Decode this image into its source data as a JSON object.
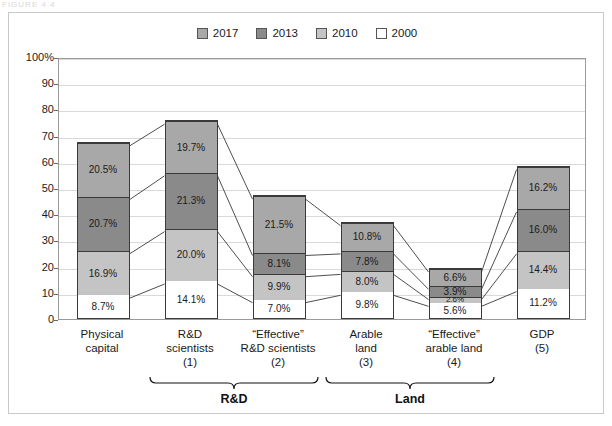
{
  "caption_fragment": "FIGURE 4.4",
  "legend": {
    "items": [
      {
        "label": "2017",
        "color": "#a8a8a8"
      },
      {
        "label": "2013",
        "color": "#8a8a8a"
      },
      {
        "label": "2010",
        "color": "#c4c4c4"
      },
      {
        "label": "2000",
        "color": "#ffffff"
      }
    ]
  },
  "axis": {
    "ticks": [
      "100%",
      "90",
      "80",
      "70",
      "60",
      "50",
      "40",
      "30",
      "20",
      "10",
      "0"
    ]
  },
  "groups": [
    {
      "label": "R&D"
    },
    {
      "label": "Land"
    }
  ],
  "chart_data": {
    "type": "bar",
    "title": "",
    "subtitle": "",
    "xlabel": "",
    "ylabel": "",
    "ylim": [
      0,
      100
    ],
    "ytick_values": [
      0,
      10,
      20,
      30,
      40,
      50,
      60,
      70,
      80,
      90,
      100
    ],
    "ytick_labels": [
      "0",
      "10",
      "20",
      "30",
      "40",
      "50",
      "60",
      "70",
      "80",
      "90",
      "100%"
    ],
    "grid": true,
    "legend_position": "top-center",
    "stacked": true,
    "categories": [
      "Physical capital",
      "R&D scientists (1)",
      "“Effective” R&D scientists (2)",
      "Arable land (3)",
      "“Effective” arable land (4)",
      "GDP (5)"
    ],
    "category_lines": [
      [
        "Physical",
        "capital"
      ],
      [
        "R&D",
        "scientists",
        "(1)"
      ],
      [
        "“Effective”",
        "R&D scientists",
        "(2)"
      ],
      [
        "Arable",
        "land",
        "(3)"
      ],
      [
        "“Effective”",
        "arable land",
        "(4)"
      ],
      [
        "GDP",
        "(5)"
      ]
    ],
    "series": [
      {
        "name": "2000",
        "color": "#ffffff",
        "values": [
          8.7,
          14.1,
          7.0,
          9.8,
          5.6,
          11.2
        ],
        "labels": [
          "8.7%",
          "14.1%",
          "7.0%",
          "9.8%",
          "5.6%",
          "11.2%"
        ]
      },
      {
        "name": "2010",
        "color": "#c4c4c4",
        "values": [
          16.9,
          20.0,
          9.9,
          8.0,
          2.6,
          14.4
        ],
        "labels": [
          "16.9%",
          "20.0%",
          "9.9%",
          "8.0%",
          "2.6%",
          "14.4%"
        ]
      },
      {
        "name": "2013",
        "color": "#8a8a8a",
        "values": [
          20.7,
          21.3,
          8.1,
          7.8,
          3.9,
          16.0
        ],
        "labels": [
          "20.7%",
          "21.3%",
          "8.1%",
          "7.8%",
          "3.9%",
          "16.0%"
        ]
      },
      {
        "name": "2017",
        "color": "#a8a8a8",
        "values": [
          20.5,
          19.7,
          21.5,
          10.8,
          6.6,
          16.2
        ],
        "labels": [
          "20.5%",
          "19.7%",
          "21.5%",
          "10.8%",
          "6.6%",
          "16.2%"
        ]
      }
    ],
    "totals": [
      66.8,
      75.1,
      46.5,
      36.4,
      18.7,
      57.8
    ],
    "connectors": true,
    "connector_note": "Thin lines connect matching segment boundaries between adjacent bars"
  }
}
